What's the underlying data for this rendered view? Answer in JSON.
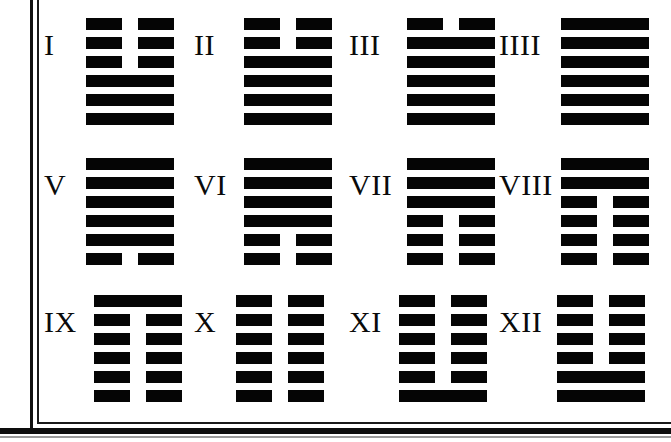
{
  "page": {
    "kind": "scanned-book-page",
    "ink_color": "#050505",
    "paper_color": "#ffffff",
    "border": {
      "style": "double-rule",
      "sides": "left-and-bottom"
    }
  },
  "hexagrams": [
    {
      "numeral": "I",
      "lines": [
        "broken",
        "broken",
        "broken",
        "solid",
        "solid",
        "solid"
      ],
      "row": 0,
      "column": 0
    },
    {
      "numeral": "II",
      "lines": [
        "broken",
        "broken",
        "solid",
        "solid",
        "solid",
        "solid"
      ],
      "row": 0,
      "column": 1
    },
    {
      "numeral": "III",
      "lines": [
        "broken",
        "solid",
        "solid",
        "solid",
        "solid",
        "solid"
      ],
      "row": 0,
      "column": 2
    },
    {
      "numeral": "IIII",
      "lines": [
        "solid",
        "solid",
        "solid",
        "solid",
        "solid",
        "solid"
      ],
      "row": 0,
      "column": 3
    },
    {
      "numeral": "V",
      "lines": [
        "solid",
        "solid",
        "solid",
        "solid",
        "solid",
        "broken"
      ],
      "row": 1,
      "column": 0
    },
    {
      "numeral": "VI",
      "lines": [
        "solid",
        "solid",
        "solid",
        "solid",
        "broken",
        "broken"
      ],
      "row": 1,
      "column": 1
    },
    {
      "numeral": "VII",
      "lines": [
        "solid",
        "solid",
        "solid",
        "broken",
        "broken",
        "broken"
      ],
      "row": 1,
      "column": 2
    },
    {
      "numeral": "VIII",
      "lines": [
        "solid",
        "solid",
        "broken",
        "broken",
        "broken",
        "broken"
      ],
      "row": 1,
      "column": 3
    },
    {
      "numeral": "IX",
      "lines": [
        "solid",
        "broken",
        "broken",
        "broken",
        "broken",
        "broken"
      ],
      "row": 2,
      "column": 0
    },
    {
      "numeral": "X",
      "lines": [
        "broken",
        "broken",
        "broken",
        "broken",
        "broken",
        "broken"
      ],
      "row": 2,
      "column": 1
    },
    {
      "numeral": "XI",
      "lines": [
        "broken",
        "broken",
        "broken",
        "broken",
        "broken",
        "solid"
      ],
      "row": 2,
      "column": 2
    },
    {
      "numeral": "XII",
      "lines": [
        "broken",
        "broken",
        "broken",
        "broken",
        "solid",
        "solid"
      ],
      "row": 2,
      "column": 3
    }
  ]
}
